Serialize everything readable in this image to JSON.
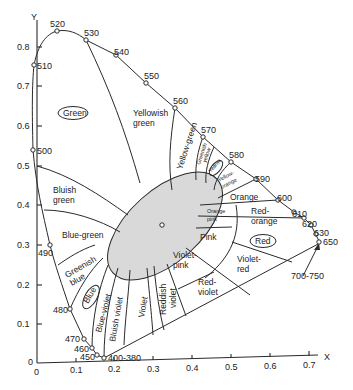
{
  "diagram": {
    "background": "#ffffff",
    "ellipse_fill": "#d9d9d9",
    "line_color": "#2a2a2a"
  },
  "axes": {
    "x_label": "X",
    "y_label": "Y",
    "x_ticks": [
      "0",
      "0.1",
      "0.2",
      "0.3",
      "0.4",
      "0.5",
      "0.6",
      "0.7"
    ],
    "y_ticks": [
      "0",
      "0.1",
      "0.2",
      "0.3",
      "0.4",
      "0.5",
      "0.6",
      "0.7",
      "0.8"
    ]
  },
  "wavelengths": {
    "w380": "400-380",
    "w450": "450",
    "w460": "460",
    "w470": "470",
    "w480": "480",
    "w490": "490",
    "w500": "500",
    "w510": "510",
    "w520": "520",
    "w530": "530",
    "w540": "540",
    "w550": "550",
    "w560": "560",
    "w570": "570",
    "w580": "580",
    "w590": "590",
    "w600": "600",
    "w610": "610",
    "w620": "620",
    "w630": "630",
    "w650": "650",
    "w700": "700-750"
  },
  "regions": {
    "green": "Green",
    "yellowish_green_1": "Yellowish",
    "yellowish_green_2": "green",
    "yellow_green": "Yellow-green",
    "greenish_yellow_1": "Greenish",
    "greenish_yellow_2": "yellow",
    "yellow": "Yellow",
    "yellow_orange_1": "Yellow-",
    "yellow_orange_2": "orange",
    "orange": "Orange",
    "red_orange_1": "Red-",
    "red_orange_2": "orange",
    "red": "Red",
    "orange_pink_1": "Orange",
    "orange_pink_2": "pink",
    "pink": "Pink",
    "violet_pink_1": "Violet-",
    "violet_pink_2": "pink",
    "violet_red_1": "Violet-",
    "violet_red_2": "red",
    "red_violet_1": "Red-",
    "red_violet_2": "violet",
    "reddish_violet_1": "Reddish",
    "reddish_violet_2": "violet",
    "violet": "Violet",
    "bluish_violet": "Bluish violet",
    "blue_violet": "Blue-violet",
    "blue": "Blue",
    "greenish_blue_1": "Greenish",
    "greenish_blue_2": "blue",
    "blue_green": "Blue-green",
    "bluish_green_1": "Bluish",
    "bluish_green_2": "green"
  }
}
